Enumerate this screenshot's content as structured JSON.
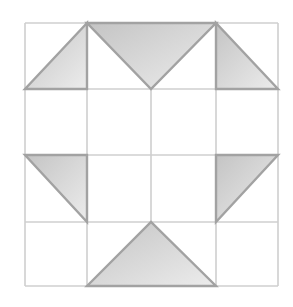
{
  "diagram": {
    "type": "quilt-block-grid",
    "grid": {
      "rows": 4,
      "cols": 4,
      "x_lines": [
        25,
        87,
        151,
        216,
        278
      ],
      "y_lines": [
        23,
        89,
        155,
        222,
        286
      ],
      "line_color": "#cfcfcf",
      "line_width": 1.6
    },
    "shape_style": {
      "fill_light": "#ececec",
      "fill_dark": "#c4c4c4",
      "stroke": "#a2a2a2",
      "stroke_width": 2.4
    },
    "triangles": [
      {
        "id": "top-left",
        "points": [
          [
            87,
            23
          ],
          [
            25,
            89
          ],
          [
            87,
            89
          ]
        ]
      },
      {
        "id": "top-center",
        "points": [
          [
            87,
            23
          ],
          [
            216,
            23
          ],
          [
            151,
            89
          ]
        ]
      },
      {
        "id": "top-right",
        "points": [
          [
            216,
            23
          ],
          [
            216,
            89
          ],
          [
            278,
            89
          ]
        ]
      },
      {
        "id": "middle-left",
        "points": [
          [
            25,
            155
          ],
          [
            87,
            155
          ],
          [
            87,
            222
          ]
        ]
      },
      {
        "id": "middle-right",
        "points": [
          [
            216,
            155
          ],
          [
            278,
            155
          ],
          [
            216,
            222
          ]
        ]
      },
      {
        "id": "bottom-center",
        "points": [
          [
            87,
            286
          ],
          [
            151,
            222
          ],
          [
            216,
            286
          ]
        ]
      }
    ]
  }
}
